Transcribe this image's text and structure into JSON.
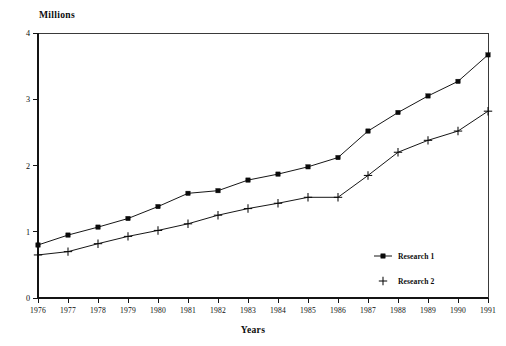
{
  "chart_data": {
    "type": "line",
    "title": "",
    "subtitle": "",
    "xlabel": "Years",
    "ylabel": "Millions",
    "ylabel_position": "top-left",
    "grid": false,
    "legend_position": "inside-bottom-right",
    "xlim": [
      1976,
      1991
    ],
    "ylim": [
      0,
      4
    ],
    "yticks": [
      0,
      1,
      2,
      3,
      4
    ],
    "ytick_labels": [
      "0",
      "1",
      "2",
      "3",
      "4"
    ],
    "x": [
      1976,
      1977,
      1978,
      1979,
      1980,
      1981,
      1982,
      1983,
      1984,
      1985,
      1986,
      1987,
      1988,
      1989,
      1990,
      1991
    ],
    "categories": [
      "1976",
      "1977",
      "1978",
      "1979",
      "1980",
      "1981",
      "1982",
      "1983",
      "1984",
      "1985",
      "1986",
      "1987",
      "1988",
      "1989",
      "1990",
      "1991"
    ],
    "series": [
      {
        "name": "Research 1",
        "marker": "square",
        "color": "#0a0a0a",
        "values": [
          0.8,
          0.95,
          1.07,
          1.2,
          1.38,
          1.58,
          1.62,
          1.78,
          1.87,
          1.98,
          2.12,
          2.52,
          2.8,
          3.05,
          3.27,
          3.67
        ]
      },
      {
        "name": "Research 2",
        "marker": "plus",
        "color": "#0a0a0a",
        "values": [
          0.65,
          0.7,
          0.82,
          0.93,
          1.02,
          1.12,
          1.25,
          1.35,
          1.43,
          1.52,
          1.52,
          1.85,
          2.2,
          2.38,
          2.52,
          2.82
        ]
      }
    ]
  },
  "labels": {
    "y_axis_title": "Millions",
    "x_axis_title": "Years"
  },
  "legend": {
    "entries": [
      {
        "label": "Research 1",
        "marker": "square"
      },
      {
        "label": "Research 2",
        "marker": "plus"
      }
    ]
  },
  "colors": {
    "background": "#ffffff",
    "ink": "#0a0a0a",
    "axis": "#141414",
    "border": "#3a3a3a"
  }
}
